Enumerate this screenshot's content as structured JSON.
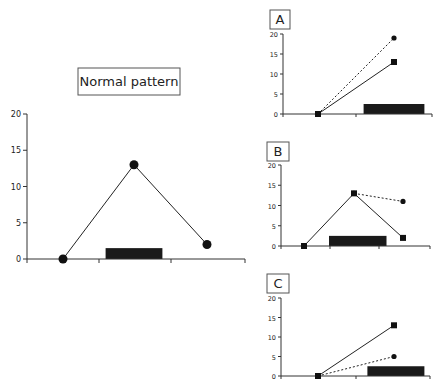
{
  "chart_data": [
    {
      "id": "normal",
      "type": "line",
      "title": "Normal pattern",
      "xlabel": "",
      "ylabel": "",
      "ylim": [
        0,
        20
      ],
      "yticks": [
        0,
        5,
        10,
        15,
        20
      ],
      "grid": false,
      "x": [
        1,
        2,
        3
      ],
      "series": [
        {
          "name": "circles-solid",
          "marker": "circle",
          "style": "solid",
          "x": [
            1,
            2,
            3
          ],
          "values": [
            0,
            13,
            2
          ]
        }
      ],
      "bar": {
        "x_start": 1.6,
        "x_end": 2.4,
        "height": 1.5,
        "color": "#1a1a1a"
      }
    },
    {
      "id": "A",
      "type": "line",
      "title": "A",
      "ylim": [
        0,
        20
      ],
      "yticks": [
        0,
        5,
        10,
        15,
        20
      ],
      "grid": false,
      "series": [
        {
          "name": "squares-solid",
          "marker": "square",
          "style": "solid",
          "x": [
            1,
            2
          ],
          "values": [
            0,
            13
          ]
        },
        {
          "name": "circles-dotted",
          "marker": "circle",
          "style": "dotted",
          "x": [
            1,
            2
          ],
          "values": [
            0,
            19
          ]
        }
      ],
      "bar": {
        "x_start": 1.6,
        "x_end": 2.4,
        "height": 2.5,
        "color": "#1a1a1a"
      }
    },
    {
      "id": "B",
      "type": "line",
      "title": "B",
      "ylim": [
        0,
        20
      ],
      "yticks": [
        0,
        5,
        10,
        15,
        20
      ],
      "grid": false,
      "series": [
        {
          "name": "squares-solid",
          "marker": "square",
          "style": "solid",
          "x": [
            1,
            2,
            3
          ],
          "values": [
            0,
            13,
            2
          ]
        },
        {
          "name": "circles-dotted",
          "marker": "circle",
          "style": "dotted",
          "x": [
            2,
            3
          ],
          "values": [
            13,
            11
          ]
        }
      ],
      "bar": {
        "x_start": 1.5,
        "x_end": 2.65,
        "height": 2.5,
        "color": "#1a1a1a"
      }
    },
    {
      "id": "C",
      "type": "line",
      "title": "C",
      "ylim": [
        0,
        20
      ],
      "yticks": [
        0,
        5,
        10,
        15,
        20
      ],
      "grid": false,
      "series": [
        {
          "name": "squares-solid",
          "marker": "square",
          "style": "solid",
          "x": [
            1,
            2
          ],
          "values": [
            0,
            13
          ]
        },
        {
          "name": "circles-dotted",
          "marker": "circle",
          "style": "dotted",
          "x": [
            1,
            2
          ],
          "values": [
            0,
            5
          ]
        }
      ],
      "bar": {
        "x_start": 1.65,
        "x_end": 2.4,
        "height": 2.5,
        "color": "#1a1a1a"
      }
    }
  ],
  "labels": {
    "normal_title": "Normal pattern",
    "panel_a": "A",
    "panel_b": "B",
    "panel_c": "C"
  },
  "colors": {
    "line": "#222222",
    "marker": "#111111",
    "bar": "#1a1a1a",
    "box_border": "#555555"
  }
}
